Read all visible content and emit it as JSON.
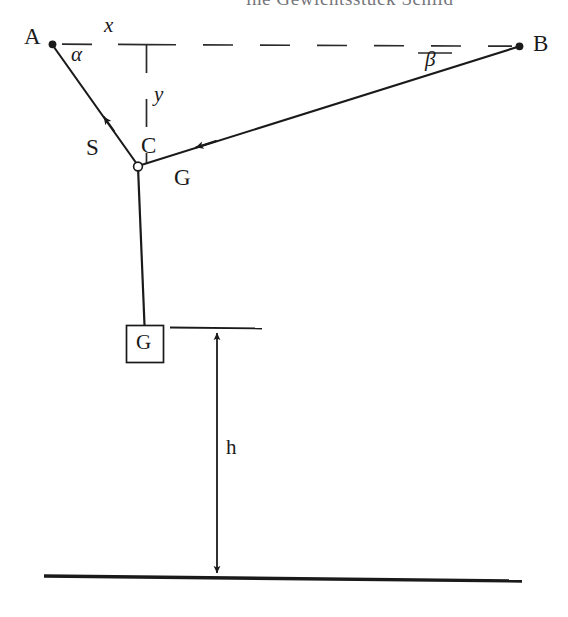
{
  "figure": {
    "kind": "statics-free-body-diagram",
    "background_color": "#ffffff",
    "ink_color": "#1a1a1a",
    "header_fragment": "ine Gewichtsstück Schild",
    "points": {
      "A": {
        "label": "A",
        "x": 52,
        "y": 44,
        "marker": "filled-dot"
      },
      "B": {
        "label": "B",
        "x": 520,
        "y": 46,
        "marker": "filled-dot"
      },
      "C": {
        "label": "C",
        "x": 138,
        "y": 166,
        "marker": "open-circle"
      }
    },
    "labels": {
      "A": "A",
      "B": "B",
      "C": "C",
      "S": "S",
      "G_rope": "G",
      "G_box": "G",
      "alpha": "α",
      "beta": "β",
      "axis_x": "x",
      "axis_y": "y",
      "height": "h"
    },
    "segments": [
      {
        "name": "cable-A-C",
        "from": "A",
        "to": "C",
        "force_label": "S",
        "arrow": "toward-A"
      },
      {
        "name": "cable-C-B",
        "from": "C",
        "to": "B",
        "force_label": "G",
        "arrow": "toward-C"
      },
      {
        "name": "rope-C-weight",
        "from": "C",
        "to": "weight-box",
        "orientation": "vertical"
      }
    ],
    "angles": {
      "alpha": {
        "label": "α",
        "at": "A",
        "between": [
          "horizontal-x-axis",
          "cable-A-C"
        ]
      },
      "beta": {
        "label": "β",
        "at": "B",
        "between": [
          "horizontal-x-axis",
          "cable-C-B"
        ]
      }
    },
    "axes": {
      "x": {
        "label": "x",
        "style": "dashed",
        "orientation": "horizontal"
      },
      "y": {
        "label": "y",
        "style": "dashed",
        "orientation": "vertical"
      }
    },
    "weight_box": {
      "label": "G",
      "x": 126,
      "y": 325,
      "width": 38,
      "height": 38
    },
    "dimension": {
      "label": "h",
      "from": "weight-box-level",
      "to": "ground-line",
      "arrows": "both-ends"
    },
    "ground": {
      "name": "ground-line",
      "style": "solid-thick"
    }
  }
}
